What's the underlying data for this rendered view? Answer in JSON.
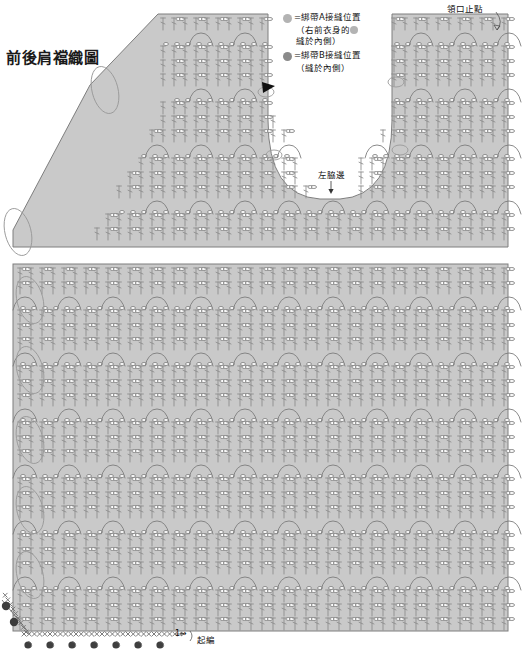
{
  "title": "前後肩襠織圖",
  "legend": {
    "items": [
      {
        "dot_color": "#b3b3b3",
        "text": "=綁帶A接縫位置",
        "sub1": "（右前衣身的",
        "sub1_dot_color": "#b3b3b3",
        "sub2": "縫於內側）"
      },
      {
        "dot_color": "#8a8a8a",
        "text": "=綁帶B接縫位置",
        "sub1": "（縫於內側）",
        "sub1_dot_color": "",
        "sub2": ""
      }
    ]
  },
  "labels": {
    "neck_stop": "領口止點",
    "left_side_seam": "左脇邊",
    "start_knitting": "起編",
    "row_one": "1→"
  },
  "colors": {
    "fabric": "#c9c9c9",
    "stitch": "#8a8a8a",
    "text": "#111111",
    "background": "#ffffff"
  },
  "chart_data": {
    "type": "diagram",
    "sections": [
      {
        "name": "yoke-upper",
        "shape": "trapezoid-with-u-neckline",
        "pattern_rows": 13,
        "motif_repeats_across": 11
      },
      {
        "name": "body-lower",
        "shape": "rectangle",
        "pattern_rows": 22,
        "motif_repeats_across": 11
      }
    ],
    "symbols": [
      {
        "name": "double-crochet",
        "glyph": "T-bar vertical"
      },
      {
        "name": "chain-stitch",
        "glyph": "oval"
      },
      {
        "name": "single-crochet",
        "glyph": "X"
      },
      {
        "name": "picot-loop",
        "glyph": "small loop"
      }
    ]
  }
}
